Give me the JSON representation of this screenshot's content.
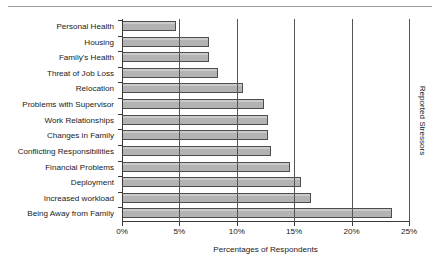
{
  "figure": {
    "top_rule": "horizontal-rule"
  },
  "chart_data": {
    "type": "bar",
    "orientation": "horizontal",
    "title": "",
    "xlabel": "Percentages of Respondents",
    "ylabel": "Reported Stressors",
    "xlim": [
      0,
      25
    ],
    "xtick_labels": [
      "0%",
      "5%",
      "10%",
      "15%",
      "20%",
      "25%"
    ],
    "xtick_values": [
      0,
      5,
      10,
      15,
      20,
      25
    ],
    "grid": "vertical",
    "legend": "none",
    "bar_color": "#b3b3b3",
    "bar_edge_color": "#4d4d4d",
    "categories": [
      "Personal Health",
      "Housing",
      "Family's Health",
      "Threat of Job Loss",
      "Relocation",
      "Problems with Supervisor",
      "Work Relationships",
      "Changes in Family",
      "Conflicting Responsibilities",
      "Financial Problems",
      "Deployment",
      "Increased workload",
      "Being Away from Family"
    ],
    "values": [
      4.7,
      7.6,
      7.6,
      8.4,
      10.5,
      12.4,
      12.7,
      12.7,
      13.0,
      14.6,
      15.6,
      16.5,
      23.5
    ]
  }
}
